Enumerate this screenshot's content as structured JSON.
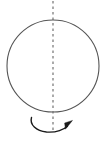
{
  "figure": {
    "type": "diagram",
    "background_color": "#ffffff",
    "canvas": {
      "width": 105,
      "height": 145
    },
    "stroke_color": "#555555",
    "axis_color": "#666666",
    "arrow_color": "#1a1a1a",
    "elements": [
      {
        "id": "sphere-outline",
        "name": "circle",
        "shape": "circle",
        "center_x": 53,
        "center_y": 66,
        "radius": 46,
        "stroke": "#555555",
        "stroke_width": 1.1,
        "fill": "none",
        "label": ""
      },
      {
        "id": "rotation-axis",
        "name": "vertical dashed axis",
        "shape": "line",
        "x1": 53,
        "y1": 1,
        "x2": 53,
        "y2": 133,
        "stroke": "#666666",
        "stroke_width": 1.1,
        "dash_pattern": "2.5 3",
        "label": ""
      },
      {
        "id": "rotation-arrow",
        "name": "curved rotation arrow",
        "shape": "arc",
        "start_x": 31,
        "start_y": 118,
        "end_x": 69,
        "end_y": 126,
        "rx": 21,
        "ry": 9,
        "sweep": "clockwise",
        "stroke": "#1a1a1a",
        "stroke_width": 1.4,
        "arrowhead": {
          "x": 71,
          "y": 123,
          "direction": "up-right",
          "fill": "#1a1a1a"
        },
        "label": ""
      }
    ],
    "annotations": [],
    "labels": []
  }
}
